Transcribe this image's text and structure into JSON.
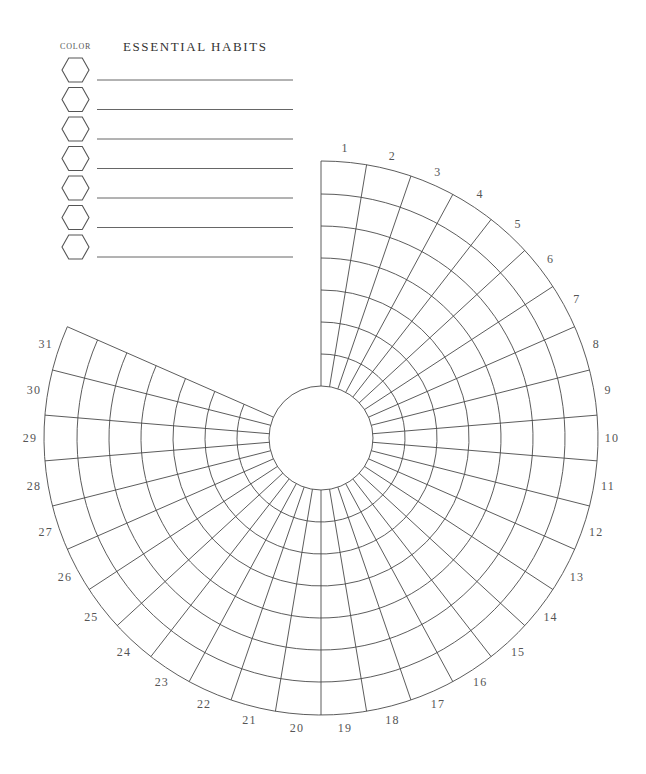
{
  "legend": {
    "color_title": "COLOR",
    "title": "ESSENTIAL HABITS",
    "rows": [
      {
        "index": 1,
        "habit": "",
        "color": ""
      },
      {
        "index": 2,
        "habit": "",
        "color": ""
      },
      {
        "index": 3,
        "habit": "",
        "color": ""
      },
      {
        "index": 4,
        "habit": "",
        "color": ""
      },
      {
        "index": 5,
        "habit": "",
        "color": ""
      },
      {
        "index": 6,
        "habit": "",
        "color": ""
      },
      {
        "index": 7,
        "habit": "",
        "color": ""
      }
    ]
  },
  "wheel": {
    "days": [
      "1",
      "2",
      "3",
      "4",
      "5",
      "6",
      "7",
      "8",
      "9",
      "10",
      "11",
      "12",
      "13",
      "14",
      "15",
      "16",
      "17",
      "18",
      "19",
      "20",
      "21",
      "22",
      "23",
      "24",
      "25",
      "26",
      "27",
      "28",
      "29",
      "30",
      "31"
    ],
    "rings": 7,
    "line_color": "#4a4a4a",
    "label_color": "#555555"
  }
}
